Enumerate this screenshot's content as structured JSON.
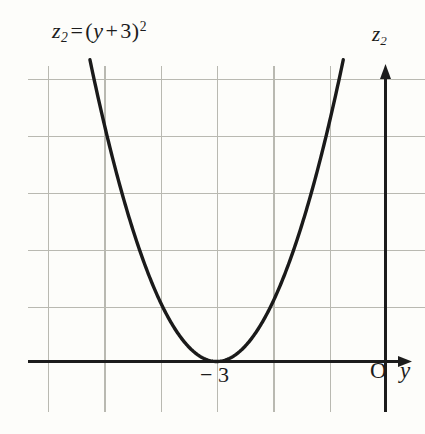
{
  "figure": {
    "title_equation": {
      "lhs_var": "z",
      "lhs_sub": "2",
      "equals": "=",
      "open_paren": "(",
      "inner_var": "y",
      "plus": "+",
      "constant": "3",
      "close_paren": ")",
      "exponent": "2",
      "plain": "z2 = (y + 3)2"
    },
    "axes": {
      "vertical_label": "z",
      "vertical_label_sub": "2",
      "horizontal_label": "y",
      "origin_label": "O"
    },
    "annotations": [
      {
        "name": "vertex-tick-label",
        "text": "− 3"
      }
    ],
    "colors": {
      "background": "#fdfdfa",
      "grid": "#b9b9b1",
      "axis": "#1c1c1c",
      "curve": "#1a1a1a",
      "text": "#1c1c1c"
    }
  },
  "chart_data": {
    "type": "line",
    "xlabel": "y",
    "ylabel": "z2",
    "grid": true,
    "legend": null,
    "function": "z2 = (y + 3)^2",
    "vertex": {
      "y": -3,
      "z2": 0
    },
    "xlim": [
      -6.35,
      0.7
    ],
    "ylim": [
      -0.9,
      5.25
    ],
    "x_tick_labels": [
      {
        "value": -3,
        "label": "− 3"
      }
    ],
    "y_tick_labels": [],
    "grid_spacing_units": 1,
    "x": [
      -5.25,
      -5.0,
      -4.5,
      -4.0,
      -3.5,
      -3.0,
      -2.5,
      -2.0,
      -1.5,
      -1.25,
      -1.0,
      -0.75
    ],
    "values": [
      5.06,
      4.0,
      2.25,
      1.0,
      0.25,
      0.0,
      0.25,
      1.0,
      2.25,
      3.06,
      4.0,
      5.06
    ],
    "series": [
      {
        "name": "z2 = (y + 3)^2",
        "x": [
          -5.25,
          -5.0,
          -4.5,
          -4.0,
          -3.5,
          -3.0,
          -2.5,
          -2.0,
          -1.5,
          -1.25,
          -1.0,
          -0.75
        ],
        "values": [
          5.06,
          4.0,
          2.25,
          1.0,
          0.25,
          0.0,
          0.25,
          1.0,
          2.25,
          3.06,
          4.0,
          5.06
        ]
      }
    ]
  }
}
